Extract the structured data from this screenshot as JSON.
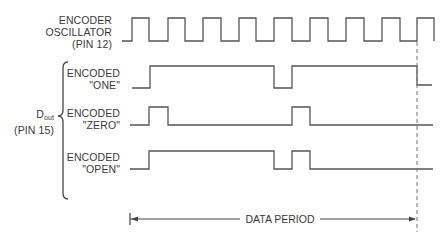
{
  "labels": {
    "oscillator": {
      "line1": "ENCODER",
      "line2": "OSCILLATOR",
      "line3": "(PIN 12)"
    },
    "dout": {
      "main": "D",
      "sub": "out",
      "pin": "(PIN 15)"
    },
    "one": {
      "line1": "ENCODED",
      "line2": "\"ONE\""
    },
    "zero": {
      "line1": "ENCODED",
      "line2": "\"ZERO\""
    },
    "open": {
      "line1": "ENCODED",
      "line2": "\"OPEN\""
    },
    "data_period": "DATA PERIOD"
  },
  "waveforms": {
    "oscillator": {
      "high_y": 18,
      "low_y": 41,
      "points": [
        [
          122,
          41
        ],
        [
          132,
          41
        ],
        [
          132,
          18
        ],
        [
          149,
          18
        ],
        [
          149,
          41
        ],
        [
          168,
          41
        ],
        [
          168,
          18
        ],
        [
          185,
          18
        ],
        [
          185,
          41
        ],
        [
          203,
          41
        ],
        [
          203,
          18
        ],
        [
          221,
          18
        ],
        [
          221,
          41
        ],
        [
          239,
          41
        ],
        [
          239,
          18
        ],
        [
          256,
          18
        ],
        [
          256,
          41
        ],
        [
          274,
          41
        ],
        [
          274,
          18
        ],
        [
          292,
          18
        ],
        [
          292,
          41
        ],
        [
          310,
          41
        ],
        [
          310,
          18
        ],
        [
          328,
          18
        ],
        [
          328,
          41
        ],
        [
          346,
          41
        ],
        [
          346,
          18
        ],
        [
          364,
          18
        ],
        [
          364,
          41
        ],
        [
          382,
          41
        ],
        [
          382,
          18
        ],
        [
          400,
          18
        ],
        [
          400,
          41
        ],
        [
          417,
          41
        ],
        [
          417,
          18
        ],
        [
          434,
          18
        ],
        [
          434,
          41
        ]
      ]
    },
    "one": {
      "points": [
        [
          132,
          88
        ],
        [
          150,
          88
        ],
        [
          150,
          66
        ],
        [
          274,
          66
        ],
        [
          274,
          88
        ],
        [
          292,
          88
        ],
        [
          292,
          66
        ],
        [
          417,
          66
        ],
        [
          417,
          85
        ],
        [
          432,
          85
        ]
      ]
    },
    "zero": {
      "points": [
        [
          130,
          125
        ],
        [
          149,
          125
        ],
        [
          149,
          107
        ],
        [
          168,
          107
        ],
        [
          168,
          125
        ],
        [
          292,
          125
        ],
        [
          292,
          107
        ],
        [
          310,
          107
        ],
        [
          310,
          125
        ],
        [
          433,
          125
        ]
      ]
    },
    "open": {
      "points": [
        [
          130,
          169
        ],
        [
          149,
          169
        ],
        [
          149,
          151
        ],
        [
          274,
          151
        ],
        [
          274,
          169
        ],
        [
          292,
          169
        ],
        [
          292,
          151
        ],
        [
          310,
          151
        ],
        [
          310,
          169
        ],
        [
          433,
          169
        ]
      ]
    }
  },
  "dashed_marker": {
    "x": 417,
    "y1": 42,
    "y2": 232
  },
  "data_period_arrow": {
    "x_start": 130,
    "x_end": 415,
    "y": 219,
    "text_x": 280
  }
}
